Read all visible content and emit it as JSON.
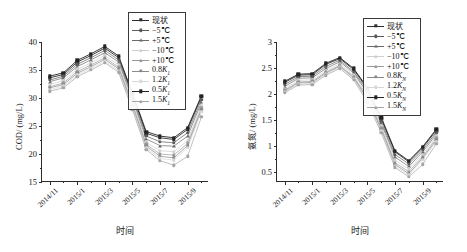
{
  "figure": {
    "xlabel": "时间",
    "x_categories": [
      "2014/11",
      "2014/12",
      "2015/1",
      "2015/2",
      "2015/3",
      "2015/4",
      "2015/5",
      "2015/6",
      "2015/7",
      "2015/8",
      "2015/9"
    ],
    "x_tick_labels": [
      "2014/11",
      "2015/1",
      "2015/3",
      "2015/5",
      "2015/7",
      "2015/9"
    ],
    "series_names_left": [
      "现状",
      "−5℃",
      "+5℃",
      "−10℃",
      "+10℃",
      "0.8K₁",
      "1.2K₁",
      "0.5K₁",
      "1.5K₁"
    ],
    "series_names_right": [
      "现状",
      "−5℃",
      "+5℃",
      "−10℃",
      "+10℃",
      "0.8K_N",
      "1.2K_N",
      "0.5K_N",
      "1.5K_N"
    ],
    "legend_labels_plain": [
      "现状",
      "−5℃",
      "+5℃",
      "−10℃",
      "+10℃",
      "0.8K",
      "1.2K",
      "0.5K",
      "1.5K"
    ],
    "subscript_left": "1",
    "subscript_right": "N",
    "colors": [
      "#2c2c2c",
      "#5a5a5a",
      "#6b6b6b",
      "#cfcfcf",
      "#9a9a9a",
      "#8a8a8a",
      "#d8d8d8",
      "#232323",
      "#a5a5a5"
    ],
    "markers": [
      "square",
      "circle",
      "triangle",
      "circle",
      "circle",
      "circle",
      "circle",
      "square",
      "circle"
    ]
  },
  "chart_data": [
    {
      "type": "line",
      "title": "",
      "panel": "left",
      "xlabel": "时间",
      "ylabel": "COD/ (mg/L)",
      "x": [
        "2014/11",
        "2014/12",
        "2015/1",
        "2015/2",
        "2015/3",
        "2015/4",
        "2015/5",
        "2015/6",
        "2015/7",
        "2015/8",
        "2015/9"
      ],
      "xtick_labels": [
        "2014/11",
        "2015/1",
        "2015/3",
        "2015/5",
        "2015/7",
        "2015/9"
      ],
      "ylim": [
        15,
        40
      ],
      "yticks": [
        15,
        20,
        25,
        30,
        35,
        40
      ],
      "grid": false,
      "legend_position": "upper-right",
      "series": [
        {
          "name": "现状",
          "values": [
            33.6,
            34.2,
            36.4,
            37.6,
            38.9,
            37.2,
            30.6,
            23.7,
            22.9,
            22.6,
            24.4,
            30.2
          ]
        },
        {
          "name": "−5℃",
          "values": [
            33.2,
            33.9,
            36.0,
            37.2,
            38.5,
            36.8,
            30.2,
            23.2,
            22.2,
            22.0,
            23.8,
            29.7
          ]
        },
        {
          "name": "+5℃",
          "values": [
            32.9,
            33.6,
            35.6,
            36.8,
            38.1,
            36.4,
            29.8,
            22.7,
            21.5,
            21.4,
            23.2,
            29.2
          ]
        },
        {
          "name": "−10℃",
          "values": [
            32.4,
            33.1,
            35.1,
            36.3,
            37.6,
            35.9,
            29.3,
            22.1,
            20.6,
            20.4,
            22.4,
            28.6
          ]
        },
        {
          "name": "+10℃",
          "values": [
            32.0,
            32.7,
            34.7,
            35.9,
            37.2,
            35.5,
            28.9,
            21.7,
            20.0,
            19.8,
            21.9,
            28.2
          ]
        },
        {
          "name": "0.8K₁",
          "values": [
            31.8,
            32.4,
            34.4,
            35.6,
            36.9,
            35.2,
            28.6,
            21.4,
            19.6,
            19.3,
            21.5,
            27.9
          ]
        },
        {
          "name": "1.2K₁",
          "values": [
            31.5,
            32.1,
            34.1,
            35.3,
            36.6,
            34.9,
            28.3,
            21.1,
            19.2,
            18.9,
            21.1,
            27.5
          ]
        },
        {
          "name": "0.5K₁",
          "values": [
            33.9,
            34.5,
            36.7,
            37.9,
            39.2,
            37.5,
            30.9,
            24.0,
            23.2,
            22.9,
            24.7,
            30.4
          ]
        },
        {
          "name": "1.5K₁",
          "values": [
            31.2,
            31.8,
            33.8,
            35.0,
            36.3,
            34.6,
            27.9,
            20.8,
            18.8,
            18.0,
            19.6,
            26.6
          ]
        }
      ]
    },
    {
      "type": "line",
      "title": "",
      "panel": "right",
      "xlabel": "时间",
      "ylabel": "氨氮/ (mg/L)",
      "x": [
        "2014/11",
        "2014/12",
        "2015/1",
        "2015/2",
        "2015/3",
        "2015/4",
        "2015/5",
        "2015/6",
        "2015/7",
        "2015/8",
        "2015/9"
      ],
      "xtick_labels": [
        "2014/11",
        "2015/1",
        "2015/3",
        "2015/5",
        "2015/7",
        "2015/9"
      ],
      "ylim": [
        0.3,
        3.0
      ],
      "yticks": [
        0.5,
        1.0,
        1.5,
        2.0,
        2.5,
        3.0
      ],
      "grid": false,
      "legend_position": "upper-right",
      "series": [
        {
          "name": "现状",
          "values": [
            2.22,
            2.36,
            2.37,
            2.57,
            2.68,
            2.47,
            2.1,
            1.52,
            0.88,
            0.69,
            0.96,
            1.3
          ]
        },
        {
          "name": "−5℃",
          "values": [
            2.18,
            2.33,
            2.34,
            2.53,
            2.65,
            2.43,
            2.06,
            1.47,
            0.83,
            0.65,
            0.92,
            1.26
          ]
        },
        {
          "name": "+5℃",
          "values": [
            2.14,
            2.3,
            2.31,
            2.49,
            2.62,
            2.4,
            2.02,
            1.43,
            0.78,
            0.6,
            0.88,
            1.22
          ]
        },
        {
          "name": "−10℃",
          "values": [
            2.1,
            2.26,
            2.27,
            2.45,
            2.58,
            2.36,
            1.97,
            1.38,
            0.72,
            0.55,
            0.83,
            1.18
          ]
        },
        {
          "name": "+10℃",
          "values": [
            2.07,
            2.23,
            2.24,
            2.42,
            2.55,
            2.33,
            1.93,
            1.34,
            0.67,
            0.5,
            0.79,
            1.14
          ]
        },
        {
          "name": "0.8K_N",
          "values": [
            2.05,
            2.21,
            2.22,
            2.4,
            2.53,
            2.31,
            1.9,
            1.31,
            0.64,
            0.46,
            0.76,
            1.11
          ]
        },
        {
          "name": "1.2K_N",
          "values": [
            2.04,
            2.19,
            2.2,
            2.38,
            2.51,
            2.29,
            1.87,
            1.28,
            0.61,
            0.43,
            0.73,
            1.08
          ]
        },
        {
          "name": "0.5K_N",
          "values": [
            2.24,
            2.38,
            2.39,
            2.59,
            2.7,
            2.49,
            2.12,
            1.55,
            0.9,
            0.71,
            0.98,
            1.32
          ]
        },
        {
          "name": "1.5K_N",
          "values": [
            2.02,
            2.17,
            2.18,
            2.36,
            2.49,
            2.27,
            1.84,
            1.25,
            0.58,
            0.4,
            0.64,
            1.04
          ]
        }
      ]
    }
  ]
}
